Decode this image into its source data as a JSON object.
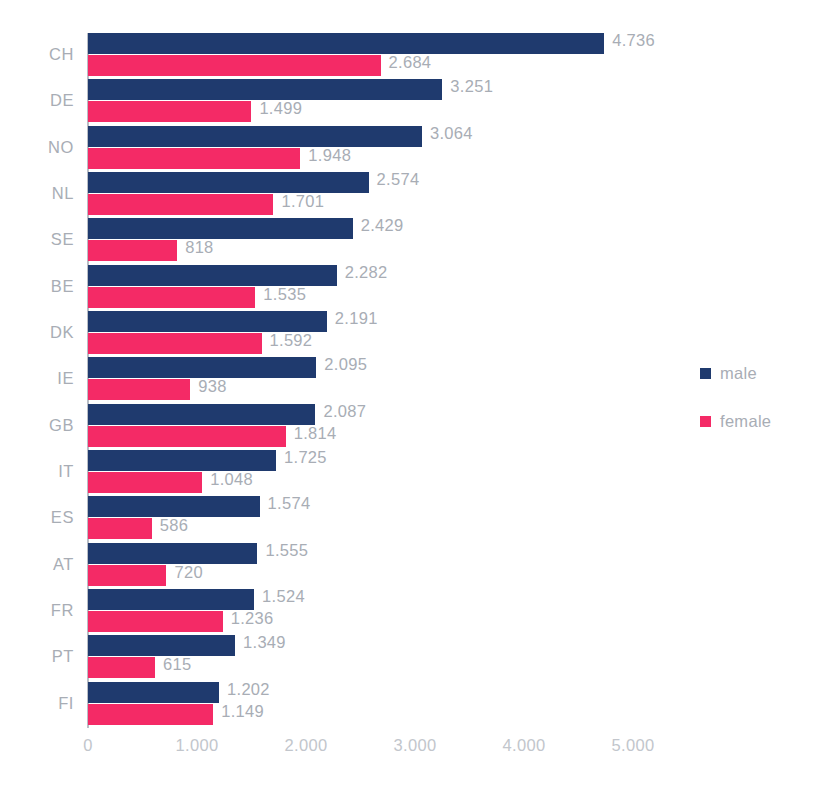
{
  "chart_data": {
    "type": "bar",
    "orientation": "horizontal",
    "title": "",
    "subtitle": "",
    "xlabel": "",
    "ylabel": "",
    "xlim": [
      0,
      5000
    ],
    "grid": false,
    "number_format": "european-thousands-dot",
    "legend_position": "right",
    "categories": [
      "CH",
      "DE",
      "NO",
      "NL",
      "SE",
      "BE",
      "DK",
      "IE",
      "GB",
      "IT",
      "ES",
      "AT",
      "FR",
      "PT",
      "FI"
    ],
    "xticks": [
      0,
      1000,
      2000,
      3000,
      4000,
      5000
    ],
    "xtick_labels": [
      "0",
      "1.000",
      "2.000",
      "3.000",
      "4.000",
      "5.000"
    ],
    "series": [
      {
        "name": "male",
        "color": "#1f3a6e",
        "values": [
          4736,
          3251,
          3064,
          2574,
          2429,
          2282,
          2191,
          2095,
          2087,
          1725,
          1574,
          1555,
          1524,
          1349,
          1202
        ],
        "labels": [
          "4.736",
          "3.251",
          "3.064",
          "2.574",
          "2.429",
          "2.282",
          "2.191",
          "2.095",
          "2.087",
          "1.725",
          "1.574",
          "1.555",
          "1.524",
          "1.349",
          "1.202"
        ]
      },
      {
        "name": "female",
        "color": "#f42a66",
        "values": [
          2684,
          1499,
          1948,
          1701,
          818,
          1535,
          1592,
          938,
          1814,
          1048,
          586,
          720,
          1236,
          615,
          1149
        ],
        "labels": [
          "2.684",
          "1.499",
          "1.948",
          "1.701",
          "818",
          "1.535",
          "1.592",
          "938",
          "1.814",
          "1.048",
          "586",
          "720",
          "1.236",
          "615",
          "1.149"
        ]
      }
    ]
  },
  "legend": {
    "items": [
      {
        "label": "male",
        "color": "#1f3a6e",
        "swatch_name": "legend-swatch-male"
      },
      {
        "label": "female",
        "color": "#f42a66",
        "swatch_name": "legend-swatch-female"
      }
    ]
  },
  "colors": {
    "male": "#1f3a6e",
    "female": "#f42a66",
    "text": "#a8adb5",
    "tick_text": "#c2c6cc",
    "axis_line": "#b9bec6",
    "background": "#ffffff"
  }
}
